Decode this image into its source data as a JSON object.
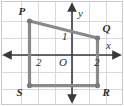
{
  "figure": {
    "border_color": "#c9c9c9",
    "grid_color": "#d9d9d9",
    "axis_color": "#3a3a3a",
    "shape_color": "#8a8a8a",
    "vertex_color": "#7a7a7a",
    "label_color": "#2b2b2b",
    "background": "#ffffff"
  },
  "axes": {
    "x_label": "x",
    "y_label": "y",
    "origin_label": "O",
    "x_tick_negative": "2",
    "x_tick_negative_display": "-2",
    "x_tick_positive": "2",
    "y_tick_positive": "1",
    "x_range": [
      -3.9,
      2.9
    ],
    "y_range": [
      -2.9,
      2.9
    ],
    "grid_spacing_units": 1,
    "grid_on": true,
    "arrowheads": [
      "x-positive",
      "x-negative",
      "y-positive",
      "y-negative"
    ]
  },
  "shape": {
    "name": "PQRS",
    "type": "quadrilateral",
    "closed": true,
    "vertices": [
      {
        "label": "P",
        "x": -2.5,
        "y": 2.0,
        "label_dx": -11,
        "label_dy": -15
      },
      {
        "label": "Q",
        "x": 1.5,
        "y": 1.0,
        "label_dx": 5,
        "label_dy": -15
      },
      {
        "label": "R",
        "x": 1.5,
        "y": -1.8,
        "label_dx": 5,
        "label_dy": 1
      },
      {
        "label": "S",
        "x": -2.5,
        "y": -1.8,
        "label_dx": -13,
        "label_dy": 1
      }
    ]
  },
  "chart_data": {
    "type": "scatter",
    "title": "",
    "xlabel": "x",
    "ylabel": "y",
    "xlim": [
      -3.9,
      2.9
    ],
    "ylim": [
      -2.9,
      2.9
    ],
    "grid": true,
    "legend": "none",
    "series": [
      {
        "name": "PQRS",
        "points": [
          {
            "label": "P",
            "x": -2.5,
            "y": 2.0
          },
          {
            "label": "Q",
            "x": 1.5,
            "y": 1.0
          },
          {
            "label": "R",
            "x": 1.5,
            "y": -1.8
          },
          {
            "label": "S",
            "x": -2.5,
            "y": -1.8
          }
        ]
      }
    ],
    "annotations": [
      "-2",
      "2",
      "1",
      "O",
      "x",
      "y"
    ]
  }
}
